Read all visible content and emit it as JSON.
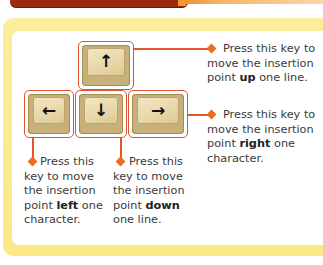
{
  "header": {
    "title": "KEYBOARD SHORTCUTS",
    "bar_color": "#9a2a12",
    "accent_color": "#f08a2a"
  },
  "panel": {
    "border_color": "#fbe98a",
    "background": "#ffffff"
  },
  "keys": [
    {
      "id": "up",
      "label": "up-arrow-key",
      "glyph": "↑"
    },
    {
      "id": "left",
      "label": "left-arrow-key",
      "glyph": "←"
    },
    {
      "id": "down",
      "label": "down-arrow-key",
      "glyph": "↓"
    },
    {
      "id": "right",
      "label": "right-arrow-key",
      "glyph": "→"
    }
  ],
  "callouts": {
    "up": {
      "pre": "Press this key to move the insertion point ",
      "bold": "up",
      "post": " one line."
    },
    "right": {
      "pre": "Press this key to move the insertion point ",
      "bold": "right",
      "post": " one character."
    },
    "left": {
      "pre": "Press this key to move the insertion point ",
      "bold": "left",
      "post": " one character."
    },
    "down": {
      "pre": "Press this key to move the insertion point ",
      "bold": "down",
      "post": " one line."
    }
  },
  "colors": {
    "outline": "#e0552a",
    "diamond": "#f26a1b",
    "key_face": "#e7d6a8",
    "text": "#3a3a3a"
  }
}
